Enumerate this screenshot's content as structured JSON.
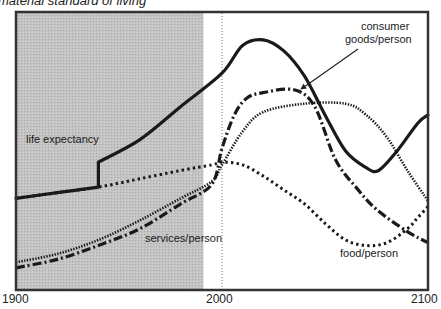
{
  "chart_data": {
    "type": "line",
    "title": "material standard of living",
    "xlabel": "",
    "ylabel": "",
    "xlim": [
      1900,
      2100
    ],
    "ylim": [
      0,
      100
    ],
    "x_ticks": [
      "1900",
      "2000",
      "2100"
    ],
    "grid": false,
    "legend": "inline labels",
    "shaded_region": {
      "from": 1900,
      "to": 1991,
      "color": "#bdbdbd",
      "meaning": "historical period"
    },
    "reference_line": {
      "x": 2000,
      "style": "dotted"
    },
    "series": [
      {
        "name": "life expectancy",
        "style": "solid",
        "x": [
          1900,
          1920,
          1940,
          1940,
          1960,
          1980,
          2000,
          2010,
          2020,
          2030,
          2040,
          2050,
          2060,
          2070,
          2076,
          2085,
          2095,
          2100
        ],
        "values": [
          33,
          35,
          37,
          46,
          54,
          66,
          78,
          88,
          90,
          86,
          77,
          63,
          50,
          44,
          43,
          50,
          60,
          63
        ]
      },
      {
        "name": "consumer goods/person",
        "style": "dash-dot",
        "x": [
          1900,
          1920,
          1940,
          1960,
          1980,
          1995,
          2000,
          2006,
          2012,
          2020,
          2035,
          2045,
          2055,
          2065,
          2075,
          2090,
          2100
        ],
        "values": [
          8,
          11,
          16,
          22,
          31,
          38,
          51,
          63,
          69,
          71,
          72,
          66,
          47,
          37,
          29,
          21,
          17
        ]
      },
      {
        "name": "services/person",
        "style": "dotted-fine",
        "x": [
          1900,
          1920,
          1940,
          1960,
          1980,
          1995,
          2000,
          2010,
          2020,
          2040,
          2060,
          2070,
          2080,
          2090,
          2100
        ],
        "values": [
          10,
          13,
          18,
          25,
          33,
          39,
          45,
          57,
          64,
          67,
          67,
          63,
          55,
          43,
          32
        ]
      },
      {
        "name": "food/person",
        "style": "dotted-coarse",
        "x": [
          1900,
          1920,
          1940,
          1960,
          1980,
          1995,
          2000,
          2010,
          2020,
          2030,
          2040,
          2050,
          2060,
          2070,
          2080,
          2090,
          2095,
          2100
        ],
        "values": [
          33,
          35,
          37,
          40,
          43,
          45,
          46,
          45,
          41,
          36,
          31,
          24,
          18,
          16,
          17,
          22,
          26,
          30
        ]
      }
    ],
    "annotations": [
      {
        "text": "life expectancy",
        "x": 1905,
        "y": 57
      },
      {
        "text": "consumer goods/person",
        "x": 2062,
        "y": 93,
        "arrow_to": {
          "x": 2038,
          "y": 71
        }
      },
      {
        "text": "services/person",
        "x": 1966,
        "y": 20
      },
      {
        "text": "food/person",
        "x": 2070,
        "y": 8
      }
    ]
  },
  "labels": {
    "title": "material standard of living",
    "x1900": "1900",
    "x2000": "2000",
    "x2100": "2100",
    "life": "life expectancy",
    "goods1": "consumer",
    "goods2": "goods/person",
    "services": "services/person",
    "food": "food/person"
  }
}
